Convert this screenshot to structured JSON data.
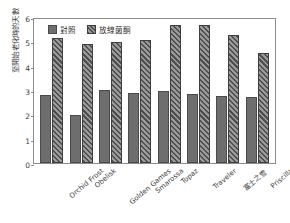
{
  "chart_data": {
    "type": "bar",
    "title": "",
    "xlabel": "",
    "ylabel": "至開始老化時的天數",
    "ylim": [
      0,
      6
    ],
    "yticks": [
      0,
      1,
      2,
      3,
      4,
      5,
      6
    ],
    "grid": false,
    "legend_position": "top-left",
    "categories": [
      "Orchid Frost",
      "Obelisk",
      "Golden Games",
      "Smarossa",
      "Topaz",
      "Traveler",
      "富士之雪",
      "Priscilla"
    ],
    "series": [
      {
        "name": "對照",
        "values": [
          2.78,
          1.97,
          3.0,
          2.87,
          2.97,
          2.85,
          2.77,
          2.73
        ]
      },
      {
        "name": "放線菌酮",
        "values": [
          5.15,
          4.88,
          4.98,
          5.05,
          5.67,
          5.66,
          5.28,
          4.53
        ]
      }
    ]
  },
  "legend": {
    "items": [
      {
        "label": "對照",
        "color": "#6e6e6e",
        "pattern": "solid"
      },
      {
        "label": "放線菌酮",
        "color": "#4f4f4f",
        "pattern": "diagonal-hatch"
      }
    ]
  },
  "colors": {
    "control_fill": "#6e6e6e",
    "treatment_fill": "#4f4f4f",
    "treatment_hatch_bg": "#9a9a9a",
    "axis": "#8c8c8c",
    "text": "#3d3d3d",
    "background": "#ffffff"
  }
}
